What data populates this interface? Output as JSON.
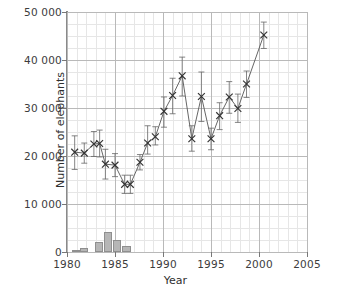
{
  "chart_data": {
    "type": "line",
    "title": "",
    "xlabel": "Year",
    "ylabel": "Number of elephants",
    "xlim": [
      1980,
      2005
    ],
    "ylim": [
      0,
      50000
    ],
    "xticks": [
      1980,
      1985,
      1990,
      1995,
      2000,
      2005
    ],
    "xticklabels": [
      "1980",
      "1985",
      "1990",
      "1995",
      "2000",
      "2005"
    ],
    "yticks": [
      0,
      10000,
      20000,
      30000,
      40000,
      50000
    ],
    "yticklabels": [
      "0",
      "10 000",
      "20 000",
      "30 000",
      "40 000",
      "50 000"
    ],
    "grid": true,
    "legend": "none",
    "marker": "x",
    "line_color": "#555555",
    "marker_color": "#333333",
    "errorbar_color": "#666666",
    "bar_color": "#b6b6b6",
    "bar_edge_color": "#8f8f8f",
    "series": [
      {
        "name": "Number of elephants",
        "x": [
          1980.8,
          1981.8,
          1982.8,
          1983.4,
          1984.0,
          1985.0,
          1986.0,
          1986.6,
          1987.6,
          1988.4,
          1989.2,
          1990.1,
          1991.0,
          1992.0,
          1993.0,
          1994.0,
          1995.0,
          1995.9,
          1996.9,
          1997.8,
          1998.7,
          2000.5
        ],
        "values": [
          20800,
          20600,
          22500,
          22600,
          18300,
          18100,
          14100,
          14100,
          18700,
          22700,
          24000,
          29300,
          32600,
          36700,
          23600,
          32400,
          23600,
          28400,
          32300,
          29900,
          35000,
          45200
        ],
        "err_lower": [
          3600,
          2100,
          2600,
          2800,
          3100,
          2400,
          1900,
          1900,
          1600,
          2300,
          1700,
          3300,
          3800,
          4200,
          2600,
          5200,
          2300,
          2900,
          3400,
          2900,
          2800,
          2800
        ],
        "err_upper": [
          3400,
          2100,
          2600,
          2800,
          3100,
          2400,
          1900,
          1900,
          1600,
          3600,
          2100,
          3000,
          3600,
          3900,
          2700,
          5100,
          2200,
          2700,
          3200,
          3000,
          2700,
          2700
        ]
      }
    ],
    "bars": {
      "name": "culled",
      "x": [
        1980.9,
        1981.8,
        1983.3,
        1984.3,
        1985.2,
        1986.2
      ],
      "values": [
        450,
        800,
        2100,
        4200,
        2500,
        1250
      ],
      "width_years": 0.85
    }
  }
}
